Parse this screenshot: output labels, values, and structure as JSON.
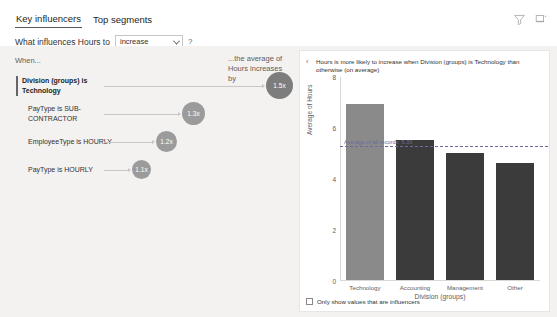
{
  "header": {
    "tabs": [
      {
        "label": "Key influencers",
        "active": true
      },
      {
        "label": "Top segments",
        "active": false
      }
    ],
    "toolbar": [
      {
        "name": "filter-icon",
        "label": "Filter"
      },
      {
        "name": "focus-mode-icon",
        "label": "Focus mode"
      }
    ]
  },
  "question": {
    "label": "What influences Hours to",
    "dropdown_value": "increase",
    "dropdown_options": [
      "increase",
      "decrease"
    ],
    "help_label": "?"
  },
  "left_panel": {
    "header_when": "When...",
    "header_average": "...the average of Hours increases by",
    "influencers": [
      {
        "label": "Division (groups) is Technology",
        "value": "1.5x",
        "selected": true
      },
      {
        "label": "PayType is SUB-CONTRACTOR",
        "value": "1.3x",
        "selected": false
      },
      {
        "label": "EmployeeType is HOURLY",
        "value": "1.2x",
        "selected": false
      },
      {
        "label": "PayType is HOURLY",
        "value": "1.1x",
        "selected": false
      }
    ]
  },
  "detail_panel": {
    "back_label": "‹",
    "title": "Hours is more likely to increase when Division (groups) is Technology than otherwise (on average)",
    "checkbox_label": "Only show values that are influencers",
    "checkbox_checked": false,
    "average_line_label": "Average of all records: 5.30"
  },
  "chart_data": {
    "type": "bar",
    "title": "Hours is more likely to increase when Division (groups) is Technology than otherwise (on average)",
    "categories": [
      "Technology",
      "Accounting",
      "Management",
      "Other"
    ],
    "values": [
      6.9,
      5.5,
      5.0,
      4.6
    ],
    "highlight_index": 0,
    "xlabel": "Division (groups)",
    "ylabel": "Average of Hours",
    "ylim": [
      0,
      8
    ],
    "yticks": [
      0,
      2,
      4,
      6,
      8
    ],
    "grid": false,
    "legend": "none",
    "reference_line": {
      "value": 5.3,
      "label": "Average of all records: 5.30"
    },
    "colors": {
      "bar": "#3b3b3b",
      "highlight": "#8a8a8a",
      "reference": "#6b6b9e"
    }
  },
  "theme": {
    "page_bg": "#f3f2f1",
    "card_bg": "#ffffff",
    "text": "#323130",
    "muted": "#605e5c",
    "bubble": "#9b9b9b"
  }
}
